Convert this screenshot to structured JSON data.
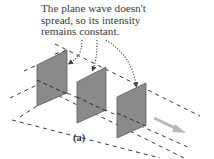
{
  "annotation": {
    "lines": [
      "The plane wave doesn't",
      "spread, so its intensity",
      "remains constant."
    ]
  },
  "figure_label": "(a)",
  "diagram": {
    "type": "plane-wave-wavefronts",
    "panels": [
      {
        "name": "wavefront-1",
        "points": "37,65 67,50 67,93 37,106"
      },
      {
        "name": "wavefront-2",
        "points": "77,82 106,67 106,110 77,123"
      },
      {
        "name": "wavefront-3",
        "points": "117,97 146,83 146,125 117,138"
      }
    ],
    "colors": {
      "panel_fill": "#8a8a8a",
      "panel_edge": "#5a5a5a",
      "dash": "#3a3a3a",
      "arrow": "#b8b8b8",
      "pointer": "#444444"
    }
  }
}
